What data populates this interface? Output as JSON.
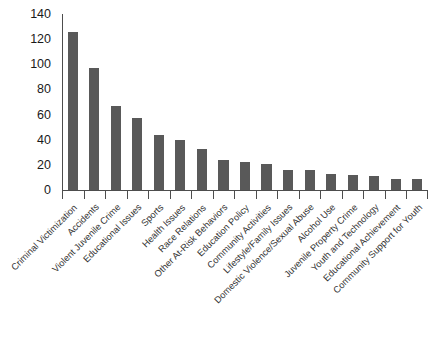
{
  "chart_data": {
    "type": "bar",
    "title": "",
    "subtitle": "",
    "xlabel": "",
    "ylabel": "",
    "ylim": [
      0,
      140
    ],
    "yticks": [
      0,
      20,
      40,
      60,
      80,
      100,
      120,
      140
    ],
    "ytick_labels": [
      "0",
      "20",
      "40",
      "60",
      "80",
      "100",
      "120",
      "140"
    ],
    "grid": false,
    "legend": null,
    "legend_position": "none",
    "bar_color": "#595959",
    "axis_color": "#4d4d4d",
    "label_rotation_deg": -45,
    "categories": [
      "Criminal Victimization",
      "Accidents",
      "Violent Juvenile Crime",
      "Educational Issues",
      "Sports",
      "Health Issues",
      "Race Relations",
      "Other At-Risk Behaviors",
      "Education Policy",
      "Community Activities",
      "Lifestyle/Family Issues",
      "Domestic Violence/Sexual Abuse",
      "Alcohol Use",
      "Juvenile Property Crime",
      "Youth and Technology",
      "Educational Achievement",
      "Community Support for Youth"
    ],
    "values": [
      126,
      97,
      67,
      57,
      44,
      40,
      33,
      24,
      22,
      21,
      16,
      16,
      13,
      12,
      11,
      9,
      9
    ]
  }
}
